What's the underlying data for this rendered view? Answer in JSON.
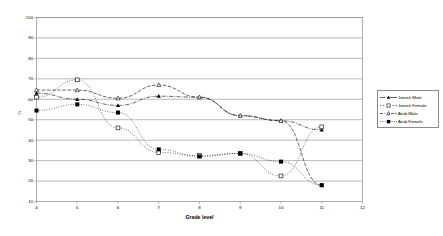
{
  "chart_data": {
    "type": "line",
    "title": "",
    "subtitle": "",
    "xlabel": "Grade level",
    "ylabel": "%",
    "xlim": [
      4,
      12
    ],
    "ylim": [
      10,
      100
    ],
    "xticks": [
      "4",
      "5",
      "6",
      "7",
      "8",
      "9",
      "10",
      "11",
      "12"
    ],
    "yticks": [
      "10",
      "20",
      "30",
      "40",
      "50",
      "60",
      "70",
      "80",
      "90",
      "100"
    ],
    "grid": "horizontal",
    "legend_position": "right",
    "x": [
      4,
      5,
      6,
      7,
      8,
      9,
      10,
      11
    ],
    "series": [
      {
        "name": "Jewish Male",
        "marker": "triangle-filled",
        "line_style": "dash-dot",
        "values": [
          63,
          60,
          57,
          61.5,
          61,
          52,
          49.5,
          45
        ]
      },
      {
        "name": "Jewish Female",
        "marker": "square-open",
        "line_style": "dotted",
        "values": [
          61,
          69.5,
          46,
          34,
          32.5,
          33.5,
          22.5,
          46.5
        ]
      },
      {
        "name": "Arab Male",
        "marker": "triangle-open",
        "line_style": "dashed",
        "values": [
          64.5,
          64.5,
          60.5,
          67,
          61,
          52,
          49.5,
          18
        ]
      },
      {
        "name": "Arab Female",
        "marker": "square-filled",
        "line_style": "dotted",
        "values": [
          54.5,
          57.5,
          53.5,
          35.5,
          32,
          33.5,
          29.5,
          18
        ]
      }
    ],
    "series_note": {
      "jewish_female_upper_tail": [
        49.5,
        46.5
      ],
      "arab_male_lower_tail": [
        29.5,
        18
      ]
    }
  },
  "legend": {
    "items": [
      {
        "label": "Jewish Male"
      },
      {
        "label": "Jewish Female"
      },
      {
        "label": "Arab Male"
      },
      {
        "label": "Arab Female"
      }
    ]
  },
  "axes": {
    "y_title": "%",
    "x_title": "Grade level"
  }
}
